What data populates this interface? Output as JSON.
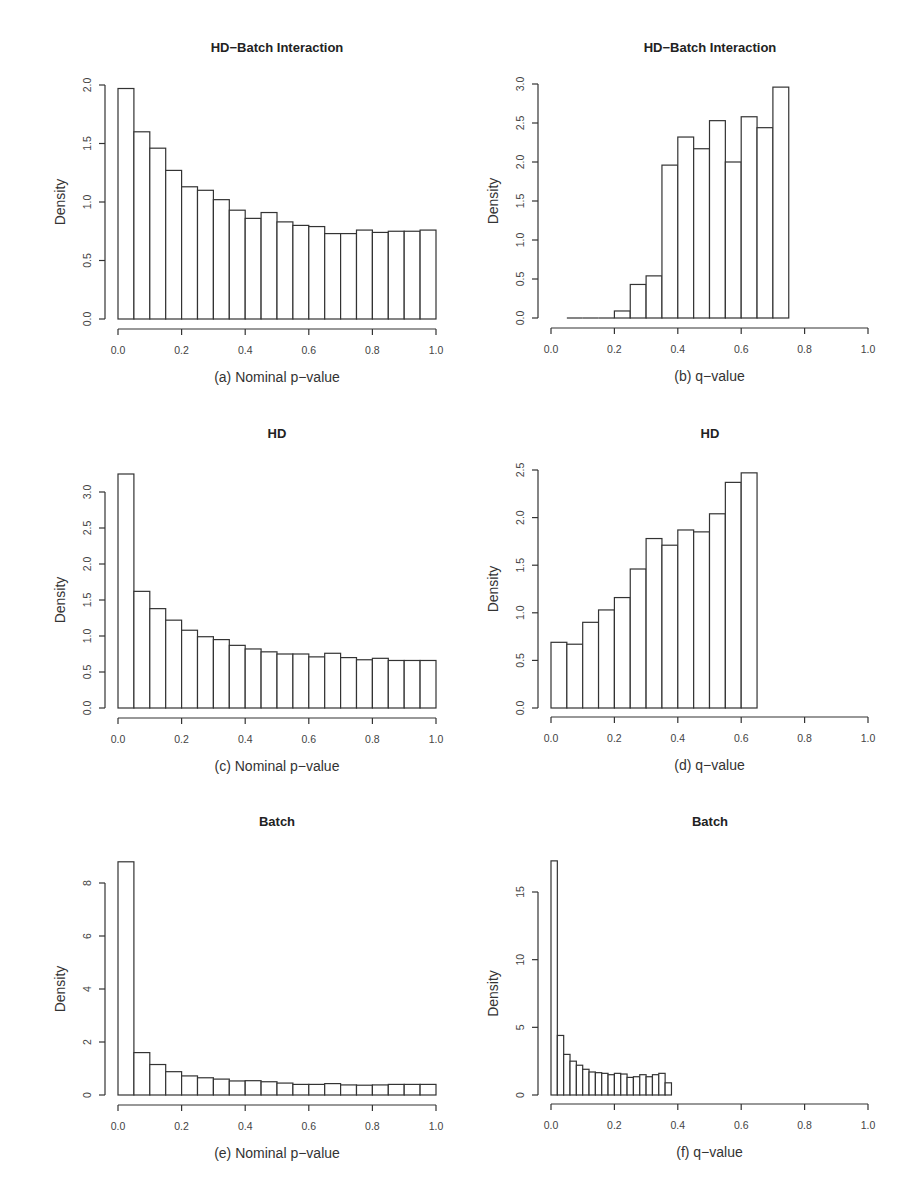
{
  "figure": {
    "panels": [
      {
        "id": "a",
        "title": "HD−Batch Interaction",
        "xlabel": "(a) Nominal p−value"
      },
      {
        "id": "b",
        "title": "HD−Batch Interaction",
        "xlabel": "(b) q−value"
      },
      {
        "id": "c",
        "title": "HD",
        "xlabel": "(c) Nominal p−value"
      },
      {
        "id": "d",
        "title": "HD",
        "xlabel": "(d) q−value"
      },
      {
        "id": "e",
        "title": "Batch",
        "xlabel": "(e) Nominal p−value"
      },
      {
        "id": "f",
        "title": "Batch",
        "xlabel": "(f) q−value"
      }
    ]
  },
  "chart_data": [
    {
      "type": "bar",
      "subtype": "histogram",
      "panel": "a",
      "title": "HD−Batch Interaction",
      "xlabel": "(a) Nominal p−value",
      "ylabel": "Density",
      "bin_width": 0.05,
      "bin_start": 0.0,
      "values": [
        1.97,
        1.6,
        1.46,
        1.27,
        1.13,
        1.1,
        1.02,
        0.93,
        0.86,
        0.91,
        0.83,
        0.8,
        0.79,
        0.73,
        0.73,
        0.76,
        0.74,
        0.75,
        0.75,
        0.76
      ],
      "xlim": [
        0,
        1
      ],
      "ylim": [
        0,
        2.0
      ],
      "xticks": [
        "0.0",
        "0.2",
        "0.4",
        "0.6",
        "0.8",
        "1.0"
      ],
      "yticks": [
        "0.0",
        "0.5",
        "1.0",
        "1.5",
        "2.0"
      ],
      "ytick_values": [
        0,
        0.5,
        1.0,
        1.5,
        2.0
      ],
      "grid": false,
      "legend": null
    },
    {
      "type": "bar",
      "subtype": "histogram",
      "panel": "b",
      "title": "HD−Batch Interaction",
      "xlabel": "(b) q−value",
      "ylabel": "Density",
      "bin_width": 0.05,
      "bin_start": 0.05,
      "values": [
        0,
        0,
        0,
        0.09,
        0.43,
        0.54,
        1.96,
        2.32,
        2.17,
        2.53,
        2.0,
        2.58,
        2.44,
        2.96
      ],
      "xlim": [
        0,
        1
      ],
      "ylim": [
        0,
        3.0
      ],
      "xticks": [
        "0.0",
        "0.2",
        "0.4",
        "0.6",
        "0.8",
        "1.0"
      ],
      "yticks": [
        "0.0",
        "0.5",
        "1.0",
        "1.5",
        "2.0",
        "2.5",
        "3.0"
      ],
      "ytick_values": [
        0,
        0.5,
        1.0,
        1.5,
        2.0,
        2.5,
        3.0
      ],
      "grid": false,
      "legend": null
    },
    {
      "type": "bar",
      "subtype": "histogram",
      "panel": "c",
      "title": "HD",
      "xlabel": "(c) Nominal p−value",
      "ylabel": "Density",
      "bin_width": 0.05,
      "bin_start": 0.0,
      "values": [
        3.25,
        1.62,
        1.38,
        1.22,
        1.08,
        0.99,
        0.95,
        0.87,
        0.82,
        0.78,
        0.75,
        0.75,
        0.71,
        0.76,
        0.7,
        0.67,
        0.69,
        0.66,
        0.66,
        0.66
      ],
      "xlim": [
        0,
        1
      ],
      "ylim": [
        0,
        3.0
      ],
      "xticks": [
        "0.0",
        "0.2",
        "0.4",
        "0.6",
        "0.8",
        "1.0"
      ],
      "yticks": [
        "0.0",
        "0.5",
        "1.0",
        "1.5",
        "2.0",
        "2.5",
        "3.0"
      ],
      "ytick_values": [
        0,
        0.5,
        1.0,
        1.5,
        2.0,
        2.5,
        3.0
      ],
      "grid": false,
      "legend": null
    },
    {
      "type": "bar",
      "subtype": "histogram",
      "panel": "d",
      "title": "HD",
      "xlabel": "(d) q−value",
      "ylabel": "Density",
      "bin_width": 0.05,
      "bin_start": 0.0,
      "values": [
        0.69,
        0.67,
        0.9,
        1.03,
        1.16,
        1.46,
        1.78,
        1.71,
        1.87,
        1.85,
        2.04,
        2.37,
        2.47
      ],
      "xlim": [
        0,
        1
      ],
      "ylim": [
        0,
        2.5
      ],
      "xticks": [
        "0.0",
        "0.2",
        "0.4",
        "0.6",
        "0.8",
        "1.0"
      ],
      "yticks": [
        "0.0",
        "0.5",
        "1.0",
        "1.5",
        "2.0",
        "2.5"
      ],
      "ytick_values": [
        0,
        0.5,
        1.0,
        1.5,
        2.0,
        2.5
      ],
      "grid": false,
      "legend": null
    },
    {
      "type": "bar",
      "subtype": "histogram",
      "panel": "e",
      "title": "Batch",
      "xlabel": "(e) Nominal p−value",
      "ylabel": "Density",
      "bin_width": 0.05,
      "bin_start": 0.0,
      "values": [
        8.8,
        1.6,
        1.15,
        0.88,
        0.72,
        0.65,
        0.6,
        0.53,
        0.54,
        0.5,
        0.45,
        0.4,
        0.4,
        0.43,
        0.38,
        0.37,
        0.38,
        0.4,
        0.4,
        0.4
      ],
      "xlim": [
        0,
        1
      ],
      "ylim": [
        0,
        8
      ],
      "xticks": [
        "0.0",
        "0.2",
        "0.4",
        "0.6",
        "0.8",
        "1.0"
      ],
      "yticks": [
        "0",
        "2",
        "4",
        "6",
        "8"
      ],
      "ytick_values": [
        0,
        2,
        4,
        6,
        8
      ],
      "grid": false,
      "legend": null
    },
    {
      "type": "bar",
      "subtype": "histogram",
      "panel": "f",
      "title": "Batch",
      "xlabel": "(f) q−value",
      "ylabel": "Density",
      "bin_width": 0.02,
      "bin_start": 0.0,
      "values": [
        17.3,
        4.4,
        3.0,
        2.5,
        2.2,
        1.9,
        1.7,
        1.65,
        1.6,
        1.5,
        1.6,
        1.55,
        1.3,
        1.35,
        1.5,
        1.35,
        1.5,
        1.6,
        0.9
      ],
      "xlim": [
        0,
        1
      ],
      "ylim": [
        0,
        15
      ],
      "xticks": [
        "0.0",
        "0.2",
        "0.4",
        "0.6",
        "0.8",
        "1.0"
      ],
      "yticks": [
        "0",
        "5",
        "10",
        "15"
      ],
      "ytick_values": [
        0,
        5,
        10,
        15
      ],
      "grid": false,
      "legend": null
    }
  ]
}
